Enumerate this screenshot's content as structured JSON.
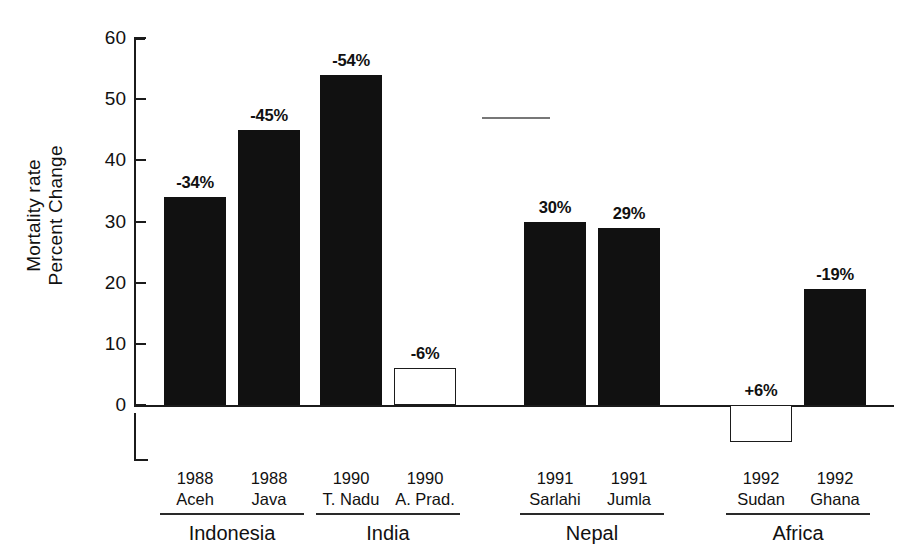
{
  "chart_data": {
    "type": "bar",
    "title": "",
    "subtitle": "",
    "xlabel": "",
    "ylabel": "Mortality rate Percent Change",
    "ylabel_lines": [
      "Mortality rate",
      "Percent Change"
    ],
    "ylim": [
      0,
      60
    ],
    "yticks": [
      0,
      10,
      20,
      30,
      40,
      50,
      60
    ],
    "ytick_labels": [
      "0",
      "10",
      "20",
      "30",
      "40",
      "50",
      "60"
    ],
    "grid": false,
    "legend": null,
    "baseline": 0,
    "categories": [
      "1988 Aceh",
      "1988 Java",
      "1990 T. Nadu",
      "1990 A. Prad.",
      "1991 Sarlahi",
      "1991 Jumla",
      "1992 Sudan",
      "1992 Ghana"
    ],
    "values": [
      34,
      45,
      54,
      6,
      30,
      29,
      -6,
      19
    ],
    "data_labels": [
      "-34%",
      "-45%",
      "-54%",
      "-6%",
      "30%",
      "29%",
      "+6%",
      "-19%"
    ],
    "bar_styles": [
      "filled",
      "filled",
      "filled",
      "hollow",
      "filled",
      "filled",
      "hollow",
      "filled"
    ],
    "groups": [
      {
        "name": "Indonesia",
        "members": [
          "1988 Aceh",
          "1988 Java"
        ]
      },
      {
        "name": "India",
        "members": [
          "1990 T. Nadu",
          "1990 A. Prad."
        ]
      },
      {
        "name": "Nepal",
        "members": [
          "1991 Sarlahi",
          "1991 Jumla"
        ]
      },
      {
        "name": "Africa",
        "members": [
          "1992 Sudan",
          "1992 Ghana"
        ]
      }
    ],
    "colors": {
      "filled_bar": "#111111",
      "hollow_bar_fill": "#ffffff",
      "outline": "#1b1b1b",
      "axis": "#1b1b1b",
      "text": "#111111",
      "background": "#ffffff"
    }
  },
  "axis": {
    "y": {
      "ticks": [
        {
          "value": 60,
          "label": "60"
        },
        {
          "value": 50,
          "label": "50"
        },
        {
          "value": 40,
          "label": "40"
        },
        {
          "value": 30,
          "label": "30"
        },
        {
          "value": 20,
          "label": "20"
        },
        {
          "value": 10,
          "label": "10"
        },
        {
          "value": 0,
          "label": "0"
        }
      ]
    }
  },
  "y_title": {
    "line1": "Mortality rate",
    "line2": "Percent Change"
  },
  "bars": [
    {
      "id": "aceh-1988",
      "year": "1988",
      "place": "Aceh",
      "label": "-34%",
      "value": 34,
      "style": "filled"
    },
    {
      "id": "java-1988",
      "year": "1988",
      "place": "Java",
      "label": "-45%",
      "value": 45,
      "style": "filled"
    },
    {
      "id": "tnadu-1990",
      "year": "1990",
      "place": "T. Nadu",
      "label": "-54%",
      "value": 54,
      "style": "filled"
    },
    {
      "id": "aprad-1990",
      "year": "1990",
      "place": "A. Prad.",
      "label": "-6%",
      "value": 6,
      "style": "hollow"
    },
    {
      "id": "sarlahi-1991",
      "year": "1991",
      "place": "Sarlahi",
      "label": "30%",
      "value": 30,
      "style": "filled"
    },
    {
      "id": "jumla-1991",
      "year": "1991",
      "place": "Jumla",
      "label": "29%",
      "value": 29,
      "style": "filled"
    },
    {
      "id": "sudan-1992",
      "year": "1992",
      "place": "Sudan",
      "label": "+6%",
      "value": -6,
      "style": "hollow"
    },
    {
      "id": "ghana-1992",
      "year": "1992",
      "place": "Ghana",
      "label": "-19%",
      "value": 19,
      "style": "filled"
    }
  ],
  "groups": [
    {
      "id": "indonesia",
      "name": "Indonesia"
    },
    {
      "id": "india",
      "name": "India"
    },
    {
      "id": "nepal",
      "name": "Nepal"
    },
    {
      "id": "africa",
      "name": "Africa"
    }
  ]
}
